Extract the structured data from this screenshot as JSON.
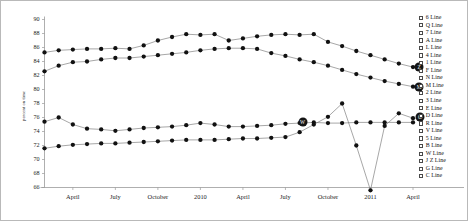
{
  "chart_data": {
    "type": "line",
    "title": "",
    "xlabel": "",
    "ylabel": "percent on time",
    "ylim": [
      66,
      90
    ],
    "ytick_step": 2,
    "yticks": [
      "90",
      "88",
      "86",
      "84",
      "82",
      "80",
      "78",
      "76",
      "74",
      "72",
      "70",
      "68",
      "66"
    ],
    "grid": false,
    "legend_position": "right",
    "x": [
      "2009-02",
      "2009-03",
      "2009-04",
      "2009-05",
      "2009-06",
      "2009-07",
      "2009-08",
      "2009-09",
      "2009-10",
      "2009-11",
      "2009-12",
      "2010-01",
      "2010-02",
      "2010-03",
      "2010-04",
      "2010-05",
      "2010-06",
      "2010-07",
      "2010-08",
      "2010-09",
      "2010-10",
      "2010-11",
      "2010-12",
      "2011-01",
      "2011-02",
      "2011-03",
      "2011-04"
    ],
    "xticks": [
      {
        "label": "April",
        "x": "2009-04"
      },
      {
        "label": "July",
        "x": "2009-07"
      },
      {
        "label": "October",
        "x": "2009-10"
      },
      {
        "label": "2010",
        "x": "2010-01"
      },
      {
        "label": "April",
        "x": "2010-04"
      },
      {
        "label": "July",
        "x": "2010-07"
      },
      {
        "label": "October",
        "x": "2010-10"
      },
      {
        "label": "2011",
        "x": "2011-01"
      },
      {
        "label": "April",
        "x": "2011-04"
      }
    ],
    "series": [
      {
        "name": "Z Line",
        "end_label": "Z",
        "values": [
          85.3,
          85.6,
          85.7,
          85.8,
          85.8,
          85.9,
          85.8,
          86.3,
          87.0,
          87.5,
          87.9,
          87.8,
          87.9,
          87.0,
          87.3,
          87.6,
          87.8,
          87.9,
          87.8,
          87.9,
          86.8,
          86.2,
          85.5,
          84.9,
          84.3,
          83.7,
          83.2
        ]
      },
      {
        "name": "M Line",
        "end_label": "M",
        "values": [
          82.6,
          83.4,
          83.9,
          84.0,
          84.3,
          84.5,
          84.5,
          84.7,
          84.9,
          85.1,
          85.3,
          85.6,
          85.8,
          85.9,
          85.9,
          85.8,
          85.2,
          84.8,
          84.3,
          83.9,
          83.4,
          82.8,
          82.2,
          81.7,
          81.2,
          80.8,
          80.4
        ]
      },
      {
        "name": "W Line",
        "end_label": "W",
        "values": [
          75.4,
          76.0,
          75.0,
          74.4,
          74.3,
          74.1,
          74.3,
          74.5,
          74.6,
          74.7,
          74.9,
          75.2,
          75.0,
          74.7,
          74.7,
          74.8,
          74.9,
          75.1,
          75.2,
          75.3,
          75.2,
          75.2,
          75.3,
          75.3,
          75.3,
          75.3,
          75.3
        ]
      },
      {
        "name": "G Line",
        "end_label": "G",
        "values": [
          71.6,
          71.9,
          72.1,
          72.2,
          72.3,
          72.3,
          72.4,
          72.5,
          72.6,
          72.7,
          72.8,
          72.8,
          72.8,
          72.9,
          73.0,
          73.0,
          73.1,
          73.2,
          73.9,
          75.0,
          76.1,
          78.0,
          72.0,
          65.6,
          74.8,
          76.6,
          75.9
        ]
      }
    ]
  },
  "legend": {
    "items": [
      {
        "label": "6 Line",
        "checked": false
      },
      {
        "label": "Q Line",
        "checked": false
      },
      {
        "label": "7 Line",
        "checked": false
      },
      {
        "label": "A Line",
        "checked": false
      },
      {
        "label": "L Line",
        "checked": false
      },
      {
        "label": "4 Line",
        "checked": false
      },
      {
        "label": "1 Line",
        "checked": false
      },
      {
        "label": "F Line",
        "checked": false
      },
      {
        "label": "N Line",
        "checked": false
      },
      {
        "label": "M Line",
        "checked": false
      },
      {
        "label": "2 Line",
        "checked": false
      },
      {
        "label": "3 Line",
        "checked": false
      },
      {
        "label": "E Line",
        "checked": false
      },
      {
        "label": "D Line",
        "checked": false
      },
      {
        "label": "R Line",
        "checked": false
      },
      {
        "label": "V Line",
        "checked": false
      },
      {
        "label": "5 Line",
        "checked": false
      },
      {
        "label": "B Line",
        "checked": false
      },
      {
        "label": "W Line",
        "checked": false
      },
      {
        "label": "J Z Line",
        "checked": false
      },
      {
        "label": "G Line",
        "checked": false
      },
      {
        "label": "C Line",
        "checked": false
      }
    ]
  },
  "colors": {
    "line": "#777777",
    "marker": "#111111",
    "axis": "#9a9a9a",
    "text": "#1c1c1c",
    "border": "#b9b9b9"
  }
}
